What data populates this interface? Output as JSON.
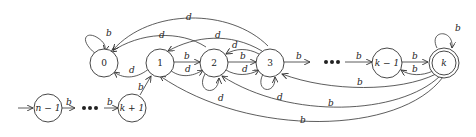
{
  "diagram": {
    "type": "state-machine",
    "states": [
      {
        "id": "q0",
        "label": "0"
      },
      {
        "id": "q1",
        "label": "1"
      },
      {
        "id": "q2",
        "label": "2"
      },
      {
        "id": "q3",
        "label": "3"
      },
      {
        "id": "qkm1",
        "label": "k − 1"
      },
      {
        "id": "qk",
        "label": "k",
        "accepting": true
      },
      {
        "id": "qnm1",
        "label": "n − 1",
        "initial": true
      },
      {
        "id": "qkp1",
        "label": "k + 1"
      }
    ],
    "ellipsis": [
      "•••",
      "•••"
    ],
    "edge_labels": {
      "b": "b",
      "d": "d"
    },
    "transitions": [
      {
        "from": "q0",
        "to": "q0",
        "label": "b"
      },
      {
        "from": "q1",
        "to": "q0",
        "label": "d"
      },
      {
        "from": "q2",
        "to": "q0",
        "label": "d"
      },
      {
        "from": "q3",
        "to": "q0",
        "label": "d"
      },
      {
        "from": "q1",
        "to": "q2",
        "label": "b"
      },
      {
        "from": "q1",
        "to": "q2",
        "label": "d"
      },
      {
        "from": "q2",
        "to": "q2",
        "label": "d"
      },
      {
        "from": "q3",
        "to": "q1",
        "label": "d"
      },
      {
        "from": "q2",
        "to": "q3",
        "label": "b"
      },
      {
        "from": "q2",
        "to": "q3",
        "label": "d"
      },
      {
        "from": "q3",
        "to": "q2",
        "label": "d"
      },
      {
        "from": "q3",
        "to": "q3",
        "label": "d"
      },
      {
        "from": "q3",
        "to": "…",
        "label": "b"
      },
      {
        "from": "…",
        "to": "qkm1",
        "label": "b"
      },
      {
        "from": "qkm1",
        "to": "qk",
        "label": "b"
      },
      {
        "from": "qk",
        "to": "qkm1",
        "label": "b"
      },
      {
        "from": "qk",
        "to": "qk",
        "label": "b"
      },
      {
        "from": "qk",
        "to": "q3",
        "label": "b"
      },
      {
        "from": "qk",
        "to": "q2",
        "label": "b"
      },
      {
        "from": "qk",
        "to": "q1",
        "label": "b"
      },
      {
        "from": "qnm1",
        "to": "…",
        "label": "b"
      },
      {
        "from": "…",
        "to": "qkp1",
        "label": "b"
      },
      {
        "from": "qkp1",
        "to": "q1",
        "label": "b"
      }
    ]
  }
}
